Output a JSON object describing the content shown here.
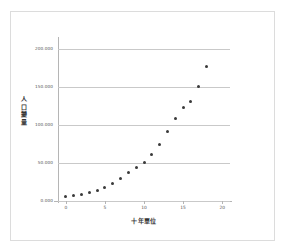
{
  "chart_data": {
    "type": "scatter",
    "title": "",
    "xlabel": "十年單位",
    "ylabel": "人口變量",
    "xlim": [
      -1,
      21
    ],
    "ylim": [
      0,
      212500
    ],
    "grid": true,
    "legend": null,
    "xticks": [
      0,
      5,
      10,
      15,
      20
    ],
    "xtick_labels": [
      "0",
      "5",
      "10",
      "15",
      "20"
    ],
    "yticks": [
      0,
      50000,
      100000,
      150000,
      200000
    ],
    "ytick_labels": [
      "0.000",
      "50.000",
      "100.000",
      "150.000",
      "200.000"
    ],
    "marker": {
      "shape": "circle",
      "color": "#3a3a3a",
      "size": 3
    },
    "x": [
      0,
      1,
      2,
      3,
      4,
      5,
      6,
      7,
      8,
      9,
      10,
      11,
      12,
      13,
      14,
      15,
      16,
      17,
      18
    ],
    "values": [
      6000,
      7000,
      9000,
      11000,
      14000,
      18000,
      23000,
      30000,
      38000,
      44000,
      50000,
      61000,
      74000,
      91000,
      108000,
      122000,
      131000,
      150000,
      177000
    ],
    "series": [
      {
        "name": "人口變量",
        "values": [
          6000,
          7000,
          9000,
          11000,
          14000,
          18000,
          23000,
          30000,
          38000,
          44000,
          50000,
          61000,
          74000,
          91000,
          108000,
          122000,
          131000,
          150000,
          177000
        ]
      }
    ]
  },
  "colors": {
    "marker": "#3a3a3a",
    "grid": "#c9c9c9",
    "axis": "#b5b5b5",
    "frame": "#dcdcdc",
    "tick_text": "#555555",
    "title_text": "#333333",
    "background": "#ffffff"
  }
}
